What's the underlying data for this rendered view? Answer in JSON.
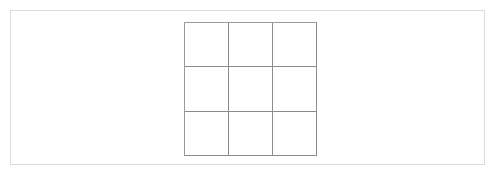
{
  "page": {
    "background_color": "#ffffff",
    "border_color": "#dcdcdc"
  },
  "board": {
    "name": "empty-3x3-grid",
    "rows": 3,
    "columns": 3,
    "line_color": "#8c8c8c",
    "outer_line_color": "#9a9a9a",
    "cell_background": "#ffffff",
    "cells": [
      {
        "row": 0,
        "col": 0,
        "mark": ""
      },
      {
        "row": 0,
        "col": 1,
        "mark": ""
      },
      {
        "row": 0,
        "col": 2,
        "mark": ""
      },
      {
        "row": 1,
        "col": 0,
        "mark": ""
      },
      {
        "row": 1,
        "col": 1,
        "mark": ""
      },
      {
        "row": 1,
        "col": 2,
        "mark": ""
      },
      {
        "row": 2,
        "col": 0,
        "mark": ""
      },
      {
        "row": 2,
        "col": 1,
        "mark": ""
      },
      {
        "row": 2,
        "col": 2,
        "mark": ""
      }
    ]
  }
}
